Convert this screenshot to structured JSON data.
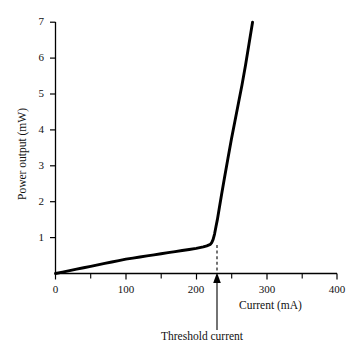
{
  "chart_data": {
    "type": "line",
    "title": "",
    "subtitle": "",
    "xlabel": "Current (mA)",
    "ylabel": "Power output (mW)",
    "xlim": [
      0,
      400
    ],
    "ylim": [
      0,
      7
    ],
    "grid": false,
    "legend": null,
    "x_ticks_major": [
      0,
      100,
      200,
      300,
      400
    ],
    "x_tick_labels": [
      "0",
      "100",
      "200",
      "300",
      "400"
    ],
    "x_ticks_minor": [
      50,
      150,
      250,
      350
    ],
    "y_ticks_major": [
      1,
      2,
      3,
      4,
      5,
      6,
      7
    ],
    "y_tick_labels": [
      "1",
      "2",
      "3",
      "4",
      "5",
      "6",
      "7"
    ],
    "series": [
      {
        "name": "Laser diode L-I characteristic",
        "x": [
          0,
          10,
          20,
          30,
          40,
          50,
          60,
          70,
          80,
          90,
          100,
          110,
          120,
          130,
          140,
          150,
          160,
          170,
          180,
          190,
          200,
          205,
          210,
          215,
          220,
          222,
          224,
          226,
          228,
          230,
          233,
          236,
          240,
          245,
          250,
          255,
          260,
          265,
          270,
          275,
          280
        ],
        "y": [
          0.0,
          0.04,
          0.08,
          0.12,
          0.16,
          0.2,
          0.24,
          0.28,
          0.32,
          0.36,
          0.4,
          0.43,
          0.46,
          0.49,
          0.52,
          0.55,
          0.58,
          0.61,
          0.64,
          0.67,
          0.7,
          0.72,
          0.74,
          0.77,
          0.81,
          0.86,
          0.95,
          1.1,
          1.3,
          1.5,
          1.85,
          2.2,
          2.65,
          3.2,
          3.75,
          4.25,
          4.75,
          5.25,
          5.8,
          6.4,
          7.0
        ]
      }
    ],
    "annotations": [
      {
        "name": "threshold-current",
        "label": "Threshold current",
        "x": 230,
        "y": 0.8,
        "marker": "dashed-drop-line-with-up-arrow"
      }
    ]
  },
  "axis": {
    "ylabel": "Power output (mW)",
    "xlabel": "Current (mA)"
  },
  "annotation": {
    "threshold_label": "Threshold current"
  },
  "colors": {
    "curve": "#000000",
    "axis": "#000000",
    "background": "#ffffff",
    "text": "#111111"
  }
}
